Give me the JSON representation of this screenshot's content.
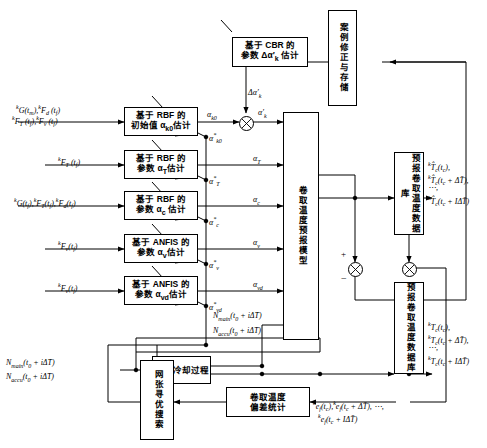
{
  "boxes": {
    "cbr": "基于 CBR 的\n参数 Δα'k 估计",
    "case_store": "案例修正与存储",
    "rbf_init": "基于 RBF 的\n初始值 αk0 估计",
    "rbf_t": "基于 RBF 的\n参数 αT 估计",
    "rbf_c": "基于 RBF 的\n参数 αc 估计",
    "anfis_v": "基于 ANFIS 的\n参数 αv 估计",
    "anfis_vd": "基于 ANFIS 的\n参数 αvd 估计",
    "model": "卷取温度预报模型",
    "db_pred": "预报卷取温度数据库",
    "db_actual": "预报卷取温度数据库",
    "laminar": "层流冷却过程",
    "dev_stat": "卷取温度偏差统计",
    "search": "网张寻优搜索"
  },
  "inputs": {
    "in1_line1": "kG(tm), kFd (tf)",
    "in1_line2": "kFT (tf), kFv (tf)",
    "in2": "kFT (tf)",
    "in3": "kG(tf), kFT(tf), kFd(tf)",
    "in4": "kFv(tf)",
    "in5": "kFv(tf)",
    "in6_line1": "Nmain(t0 + iΔT)",
    "in6_line2": "Naccu(t0 + iΔT)"
  },
  "signals": {
    "alpha_k0": "αk0",
    "delta_alpha_k": "Δα'k",
    "alpha_k_prime": "α'k",
    "alpha_T": "αT",
    "alpha_c": "αc",
    "alpha_v": "αv",
    "alpha_vd": "αvd",
    "star_k0": "α*k0",
    "star_T": "α*T",
    "star_c": "α*c",
    "star_v": "α*v",
    "star_vd": "α*vd",
    "n_main": "Nmain(t0 + iΔT)",
    "n_accu": "Naccu(t0 + iΔT)",
    "plus": "+",
    "minus": "−"
  },
  "outputs": {
    "pred_l1": "kT̂c(tc),",
    "pred_l2": "kT̂c(tc + ΔT),",
    "pred_l3": "⋯,",
    "pred_l4": "kT̂c(tc + IΔT)",
    "act_l1": "kTc(tc),",
    "act_l2": "kTc(tc + ΔT),",
    "act_l3": "⋯,",
    "act_l4": "kTc(tc + IΔT)",
    "err_l1": "ke f(tc), ke f(tc + ΔT), ⋯,",
    "err_l2": "ke f(tc + IΔT)"
  },
  "colors": {
    "line": "#000000",
    "background": "#ffffff"
  }
}
